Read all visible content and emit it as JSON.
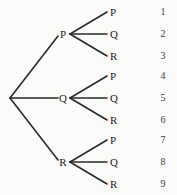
{
  "diagram": {
    "type": "probability-tree-diagram",
    "colors": {
      "background": "#fbfbfa",
      "line": "#2a2a2a",
      "text": "#1c1c1c",
      "number_text": "#3a3a3a"
    },
    "root": {
      "x": 10,
      "y": 98
    },
    "branches": [
      {
        "label": "P",
        "x": 63,
        "y": 34,
        "line_x": 60,
        "fan_x": 70,
        "leaves": [
          {
            "label": "P",
            "x": 111,
            "y": 12,
            "number": "1"
          },
          {
            "label": "Q",
            "x": 111,
            "y": 34,
            "number": "2"
          },
          {
            "label": "R",
            "x": 111,
            "y": 56,
            "number": "3"
          }
        ]
      },
      {
        "label": "Q",
        "x": 63,
        "y": 98,
        "line_x": 60,
        "fan_x": 70,
        "leaves": [
          {
            "label": "P",
            "x": 111,
            "y": 76,
            "number": "4"
          },
          {
            "label": "Q",
            "x": 111,
            "y": 98,
            "number": "5"
          },
          {
            "label": "R",
            "x": 111,
            "y": 120,
            "number": "6"
          }
        ]
      },
      {
        "label": "R",
        "x": 63,
        "y": 162,
        "line_x": 60,
        "fan_x": 70,
        "leaves": [
          {
            "label": "P",
            "x": 111,
            "y": 140,
            "number": "7"
          },
          {
            "label": "Q",
            "x": 111,
            "y": 162,
            "number": "8"
          },
          {
            "label": "R",
            "x": 111,
            "y": 184,
            "number": "9"
          }
        ]
      }
    ],
    "outcome_column_x": 163,
    "outcomes": [
      "1",
      "2",
      "3",
      "4",
      "5",
      "6",
      "7",
      "8",
      "9"
    ]
  }
}
